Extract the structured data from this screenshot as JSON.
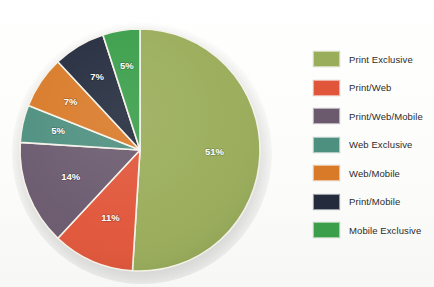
{
  "chart_data": {
    "type": "pie",
    "title": "",
    "subtitle": "",
    "xlabel": "",
    "ylabel": "",
    "grid": false,
    "legend_position": "right",
    "start_angle_deg": 0,
    "direction": "clockwise",
    "units": "%",
    "categories": [
      "Print Exclusive",
      "Print/Web",
      "Print/Web/Mobile",
      "Web Exclusive",
      "Web/Mobile",
      "Print/Mobile",
      "Mobile Exclusive"
    ],
    "values": [
      51,
      11,
      14,
      5,
      7,
      7,
      5
    ],
    "data_labels": [
      "51%",
      "11%",
      "14%",
      "5%",
      "7%",
      "7%",
      "5%"
    ],
    "colors": [
      "#9aad5a",
      "#e1563a",
      "#6b5a6e",
      "#4e9080",
      "#d97a28",
      "#232b3d",
      "#3a9e4a"
    ],
    "slices": [
      {
        "label": "Print Exclusive",
        "value": 51,
        "data_label": "51%",
        "color": "#9aad5a"
      },
      {
        "label": "Print/Web",
        "value": 11,
        "data_label": "11%",
        "color": "#e1563a"
      },
      {
        "label": "Print/Web/Mobile",
        "value": 14,
        "data_label": "14%",
        "color": "#6b5a6e"
      },
      {
        "label": "Web Exclusive",
        "value": 5,
        "data_label": "5%",
        "color": "#4e9080"
      },
      {
        "label": "Web/Mobile",
        "value": 7,
        "data_label": "7%",
        "color": "#d97a28"
      },
      {
        "label": "Print/Mobile",
        "value": 7,
        "data_label": "7%",
        "color": "#232b3d"
      },
      {
        "label": "Mobile Exclusive",
        "value": 5,
        "data_label": "5%",
        "color": "#3a9e4a"
      }
    ]
  },
  "legend": {
    "items": [
      {
        "label": "Print Exclusive",
        "color": "#9aad5a"
      },
      {
        "label": "Print/Web",
        "color": "#e1563a"
      },
      {
        "label": "Print/Web/Mobile",
        "color": "#6b5a6e"
      },
      {
        "label": "Web Exclusive",
        "color": "#4e9080"
      },
      {
        "label": "Web/Mobile",
        "color": "#d97a28"
      },
      {
        "label": "Print/Mobile",
        "color": "#232b3d"
      },
      {
        "label": "Mobile Exclusive",
        "color": "#3a9e4a"
      }
    ]
  }
}
